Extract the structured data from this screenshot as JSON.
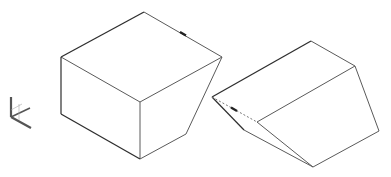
{
  "viewport": {
    "width": 391,
    "height": 177,
    "background": "#ffffff"
  },
  "colors": {
    "edge": "#5a5a5a",
    "edge_dark": "#2e2e2e",
    "hidden": "#7a7a7a",
    "ucs": "#555555"
  },
  "ucs_icon": {
    "name": "ucs-axis-icon"
  },
  "shapes": [
    {
      "name": "beveled-box",
      "description": "box with chamfered right-front edge"
    },
    {
      "name": "wedge",
      "description": "wedge solid with hidden dashed edge"
    }
  ]
}
